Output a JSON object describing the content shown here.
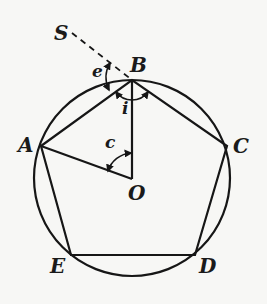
{
  "diagram": {
    "circle": {
      "cx": 132,
      "cy": 178,
      "r": 98
    },
    "points": {
      "A": {
        "label": "A",
        "x": 41,
        "y": 146
      },
      "B": {
        "label": "B",
        "x": 132,
        "y": 80
      },
      "C": {
        "label": "C",
        "x": 227,
        "y": 146
      },
      "D": {
        "label": "D",
        "x": 195,
        "y": 255
      },
      "E": {
        "label": "E",
        "x": 71,
        "y": 255
      },
      "O": {
        "label": "O",
        "x": 132,
        "y": 179
      },
      "S": {
        "label": "S"
      }
    },
    "angles": {
      "e": {
        "label": "e",
        "description": "exterior angle at B between SB extension and BA"
      },
      "i": {
        "label": "i",
        "description": "interior angle ABC"
      },
      "c": {
        "label": "c",
        "description": "central angle AOB"
      }
    },
    "edges": [
      "AB",
      "BC",
      "CD",
      "DE",
      "EA",
      "OA",
      "OB"
    ],
    "dashed": [
      "SB"
    ]
  }
}
